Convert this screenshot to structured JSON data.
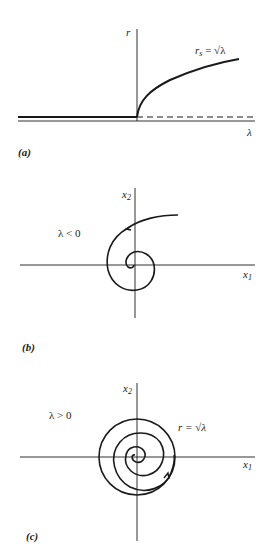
{
  "panels": [
    {
      "id": "a",
      "caption": "(a)",
      "axis_labels": {
        "vertical": "r",
        "horizontal": "λ"
      },
      "curve_label": {
        "lhs": "r",
        "lhs_sub": "s",
        "rhs": "= √λ"
      },
      "description": "Bifurcation diagram: r = 0 for λ < 0 (thick, stable), dashed for λ > 0 (unstable), branch r_s = √λ for λ > 0"
    },
    {
      "id": "b",
      "caption": "(b)",
      "axis_labels": {
        "vertical": "x",
        "vertical_sub": "2",
        "horizontal": "x",
        "horizontal_sub": "1"
      },
      "condition": "λ < 0",
      "description": "Phase portrait: trajectory spirals inward to origin"
    },
    {
      "id": "c",
      "caption": "(c)",
      "axis_labels": {
        "vertical": "x",
        "vertical_sub": "2",
        "horizontal": "x",
        "horizontal_sub": "1"
      },
      "condition": "λ > 0",
      "cycle_label": "r = √λ",
      "description": "Phase portrait: trajectory spirals outward to limit cycle of radius √λ"
    }
  ]
}
